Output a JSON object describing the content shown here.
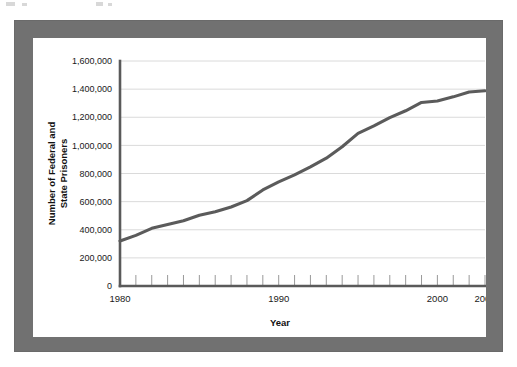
{
  "frame": {
    "border_color": "#717171",
    "background_color": "#ffffff"
  },
  "chart_data": {
    "type": "line",
    "title": "",
    "xlabel": "Year",
    "ylabel": "Number of Federal and State Prisoners",
    "ylabel_line1": "Number of Federal and",
    "ylabel_line2": "State Prisoners",
    "xlim": [
      1980,
      2003
    ],
    "ylim": [
      0,
      1600000
    ],
    "grid": true,
    "legend": "none",
    "line_color": "#5b5b5b",
    "ytick_labels": [
      "0",
      "200,000",
      "400,000",
      "600,000",
      "800,000",
      "1,000,000",
      "1,200,000",
      "1,400,000",
      "1,600,000"
    ],
    "ytick_values": [
      0,
      200000,
      400000,
      600000,
      800000,
      1000000,
      1200000,
      1400000,
      1600000
    ],
    "xtick_labels": [
      "1980",
      "1990",
      "2000",
      "2003"
    ],
    "xtick_values": [
      1980,
      1990,
      2000,
      2003
    ],
    "x": [
      1980,
      1981,
      1982,
      1983,
      1984,
      1985,
      1986,
      1987,
      1988,
      1989,
      1990,
      1991,
      1992,
      1993,
      1994,
      1995,
      1996,
      1997,
      1998,
      1999,
      2000,
      2001,
      2002,
      2003
    ],
    "series": [
      {
        "name": "Number of Federal and State Prisoners",
        "values": [
          320000,
          360000,
          410000,
          437000,
          464000,
          503000,
          528000,
          562000,
          607000,
          683000,
          740000,
          790000,
          847000,
          909000,
          990000,
          1085000,
          1138000,
          1197000,
          1246000,
          1305000,
          1316000,
          1345000,
          1380000,
          1388000
        ]
      }
    ]
  }
}
